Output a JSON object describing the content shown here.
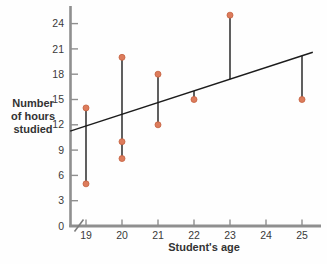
{
  "chart_data": {
    "type": "scatter",
    "title": "",
    "xlabel": "Student's age",
    "ylabel": "Number of hours studied",
    "ylabel_lines": [
      "Number",
      "of hours",
      "studied"
    ],
    "x_ticks": [
      19,
      20,
      21,
      22,
      23,
      24,
      25
    ],
    "y_ticks": [
      0,
      3,
      6,
      9,
      12,
      15,
      18,
      21,
      24
    ],
    "xlim": [
      18.55,
      25.6
    ],
    "ylim": [
      0,
      26
    ],
    "x_axis_break": true,
    "grid": false,
    "legend": "none",
    "points": [
      {
        "x": 19,
        "y": 14
      },
      {
        "x": 19,
        "y": 5
      },
      {
        "x": 20,
        "y": 20
      },
      {
        "x": 20,
        "y": 10
      },
      {
        "x": 20,
        "y": 8
      },
      {
        "x": 21,
        "y": 18
      },
      {
        "x": 21,
        "y": 12
      },
      {
        "x": 22,
        "y": 15
      },
      {
        "x": 23,
        "y": 25
      },
      {
        "x": 25,
        "y": 15
      }
    ],
    "regression_line": {
      "x1": 18.56,
      "y1": 11.25,
      "x2": 25.3,
      "y2": 20.6
    },
    "residual_segments": [
      {
        "x": 19,
        "y_from": 5,
        "y_to": 14
      },
      {
        "x": 20,
        "y_from": 8,
        "y_to": 20
      },
      {
        "x": 21,
        "y_from": 12,
        "y_to": 18
      },
      {
        "x": 22,
        "y_from": 15,
        "y_to": 16.0
      },
      {
        "x": 23,
        "y_from": 17.4,
        "y_to": 25
      },
      {
        "x": 25,
        "y_from": 15,
        "y_to": 20.2
      }
    ],
    "colors": {
      "point_fill": "#dd7c5c",
      "point_stroke": "#c4613f",
      "line": "#1c1c1c",
      "axis": "#8f8f8f",
      "text": "#3a3a3a"
    }
  }
}
